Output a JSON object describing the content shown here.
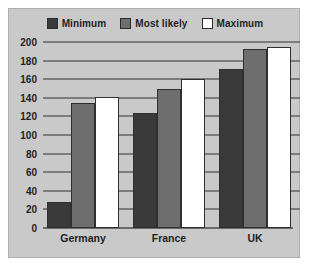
{
  "chart_data": {
    "type": "bar",
    "title": "",
    "subtitle": "",
    "xlabel": "",
    "ylabel": "",
    "categories": [
      "Germany",
      "France",
      "UK"
    ],
    "series": [
      {
        "name": "Minimum",
        "color": "#3a3a3a",
        "values": [
          28,
          124,
          171
        ]
      },
      {
        "name": "Most likely",
        "color": "#6e6e6e",
        "values": [
          134,
          150,
          193
        ]
      },
      {
        "name": "Maximum",
        "color": "#ffffff",
        "values": [
          141,
          160,
          195
        ]
      }
    ],
    "ylim": [
      0,
      200
    ],
    "ytick_step": 20,
    "yticks": [
      200,
      180,
      160,
      140,
      120,
      100,
      80,
      60,
      40,
      20,
      0
    ],
    "grid": true,
    "legend_position": "top-center",
    "orientation": "vertical",
    "grouping": "clustered"
  },
  "style": {
    "panel_background": "#c9c9c9",
    "page_background": "#ffffff",
    "gridline_color": "#7c7c7c",
    "text_color": "#1f1f1f",
    "bar_border_color": "#2f2f2f"
  }
}
